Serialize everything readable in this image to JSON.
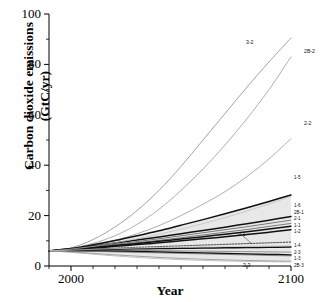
{
  "chart_data": {
    "type": "line",
    "title": "",
    "xlabel": "Year",
    "ylabel": "Carbon dioxide emissions (GtC/yr)",
    "xlim": [
      1990,
      2100
    ],
    "ylim": [
      0,
      100
    ],
    "xticks": [
      2000,
      2100
    ],
    "xtick_labels": [
      "2000",
      "2100"
    ],
    "xminor_ticks": [
      1990,
      2010,
      2020,
      2030,
      2040,
      2050,
      2060,
      2070,
      2080,
      2090
    ],
    "yticks": [
      0,
      20,
      40,
      60,
      80,
      100
    ],
    "ytick_labels": [
      "0",
      "20",
      "40",
      "60",
      "80",
      "100"
    ],
    "yminor_ticks": [
      10,
      30,
      50,
      70,
      90
    ],
    "grid": false,
    "legend": "inline-end-labels",
    "shaded_band": {
      "label": "scenario range envelope",
      "color": "#e8e8e8",
      "upper_2100": 30.5,
      "lower_2100": 4.0
    },
    "x": [
      1990,
      2000,
      2010,
      2020,
      2030,
      2040,
      2050,
      2060,
      2070,
      2080,
      2090,
      2100
    ],
    "series": [
      {
        "name": "3-2",
        "label": "3-2",
        "color": "#8c8c8c",
        "width": 0.8,
        "dash": "none",
        "label_pos": {
          "x": 246,
          "y": 40
        },
        "values": [
          6.0,
          7.2,
          10.5,
          15.5,
          22.0,
          30.0,
          39.5,
          50.0,
          60.5,
          71.0,
          81.0,
          90.5
        ]
      },
      {
        "name": "2B-2",
        "label": "2B-2",
        "color": "#9a9a9a",
        "width": 0.8,
        "dash": "none",
        "label_pos": {
          "x": 304,
          "y": 49
        },
        "values": [
          6.0,
          7.0,
          9.0,
          12.0,
          16.5,
          22.5,
          30.0,
          38.5,
          48.0,
          58.5,
          70.0,
          83.0
        ]
      },
      {
        "name": "2-2",
        "label": "2-2",
        "color": "#9a9a9a",
        "width": 0.8,
        "dash": "none",
        "label_pos": {
          "x": 304,
          "y": 121
        },
        "values": [
          6.0,
          6.8,
          8.2,
          10.2,
          12.8,
          16.0,
          20.0,
          24.5,
          29.5,
          35.5,
          42.5,
          50.5
        ]
      },
      {
        "name": "1-5",
        "label": "1-5",
        "color": "#111111",
        "width": 1.5,
        "dash": "none",
        "values": [
          6.0,
          6.9,
          8.4,
          10.1,
          12.0,
          14.0,
          16.2,
          18.4,
          20.7,
          23.1,
          25.6,
          28.2
        ]
      },
      {
        "name": "1-6",
        "label": "1-6",
        "color": "#111111",
        "width": 1.5,
        "dash": "none",
        "values": [
          6.0,
          6.8,
          7.9,
          9.1,
          10.3,
          11.5,
          12.8,
          14.1,
          15.4,
          16.8,
          18.2,
          19.6
        ]
      },
      {
        "name": "2B-1",
        "label": "2B-1",
        "color": "#5a5a5a",
        "width": 0.8,
        "dash": "none",
        "values": [
          6.0,
          6.7,
          7.6,
          8.6,
          9.7,
          10.8,
          12.0,
          13.2,
          14.4,
          15.6,
          16.9,
          18.2
        ]
      },
      {
        "name": "2-1",
        "label": "2-1",
        "color": "#5a5a5a",
        "width": 0.8,
        "dash": "none",
        "values": [
          6.0,
          6.6,
          7.4,
          8.3,
          9.2,
          10.2,
          11.2,
          12.3,
          13.4,
          14.5,
          15.7,
          16.9
        ]
      },
      {
        "name": "1-1",
        "label": "1-1",
        "color": "#111111",
        "width": 1.5,
        "dash": "none",
        "values": [
          6.0,
          6.6,
          7.3,
          8.1,
          8.9,
          9.8,
          10.7,
          11.6,
          12.6,
          13.6,
          14.7,
          15.8
        ]
      },
      {
        "name": "1-2",
        "label": "1-2",
        "color": "#111111",
        "width": 1.5,
        "dash": "none",
        "values": [
          6.0,
          6.5,
          7.1,
          7.8,
          8.5,
          9.2,
          10.0,
          10.8,
          11.6,
          12.5,
          13.4,
          14.4
        ]
      },
      {
        "name": "3-1",
        "label": "3-1",
        "color": "#222222",
        "width": 0.9,
        "dash": "1.6,1.4",
        "label_pos": {
          "x": 238,
          "y": 232
        },
        "values": [
          6.0,
          6.4,
          6.8,
          7.1,
          7.4,
          7.7,
          8.0,
          8.3,
          8.6,
          8.9,
          9.2,
          9.5
        ]
      },
      {
        "name": "1-4",
        "label": "1-4",
        "color": "#111111",
        "width": 1.5,
        "dash": "none",
        "values": [
          6.0,
          6.2,
          6.4,
          6.6,
          6.8,
          6.9,
          7.0,
          7.1,
          7.2,
          7.3,
          7.4,
          7.5
        ]
      },
      {
        "name": "2-3",
        "label": "2-3",
        "color": "#7a7a7a",
        "width": 0.8,
        "dash": "none",
        "values": [
          6.0,
          6.1,
          6.2,
          6.2,
          6.2,
          6.1,
          6.0,
          5.9,
          5.8,
          5.7,
          5.6,
          5.5
        ]
      },
      {
        "name": "1-3",
        "label": "1-3",
        "color": "#111111",
        "width": 1.5,
        "dash": "none",
        "values": [
          6.0,
          6.0,
          6.0,
          5.9,
          5.8,
          5.6,
          5.4,
          5.2,
          5.0,
          4.8,
          4.6,
          4.4
        ]
      },
      {
        "name": "2B-3",
        "label": "2B-3",
        "color": "#7a7a7a",
        "width": 0.8,
        "dash": "none",
        "values": [
          6.0,
          5.9,
          5.8,
          5.6,
          5.4,
          5.2,
          5.0,
          4.8,
          4.6,
          4.4,
          4.2,
          4.0
        ]
      },
      {
        "name": "3-3",
        "label": "3-3",
        "color": "#8c8c8c",
        "width": 0.8,
        "dash": "none",
        "label_pos": {
          "x": 243,
          "y": 263
        },
        "values": [
          6.0,
          5.6,
          5.0,
          4.4,
          3.9,
          3.4,
          3.0,
          2.7,
          2.4,
          2.2,
          2.0,
          1.9
        ]
      },
      {
        "name": "lower-gray-a",
        "label": "",
        "color": "#a8a8a8",
        "width": 0.7,
        "dash": "none",
        "values": [
          6.0,
          5.4,
          4.7,
          4.0,
          3.4,
          2.9,
          2.5,
          2.2,
          2.0,
          1.8,
          1.7,
          1.6
        ]
      },
      {
        "name": "mid-gray-b",
        "label": "",
        "color": "#bdbdbd",
        "width": 0.7,
        "dash": "none",
        "values": [
          6.0,
          6.7,
          7.8,
          9.2,
          10.8,
          12.6,
          14.6,
          16.8,
          19.2,
          21.8,
          24.6,
          27.6
        ]
      },
      {
        "name": "mid-gray-c",
        "label": "",
        "color": "#c8c8c8",
        "width": 0.7,
        "dash": "none",
        "values": [
          6.0,
          6.3,
          6.6,
          6.9,
          7.1,
          7.3,
          7.5,
          7.6,
          7.7,
          7.8,
          7.9,
          8.0
        ]
      }
    ],
    "end_labels_top": [
      "1-5"
    ],
    "end_labels_mid": [
      "1-6",
      "2B-1",
      "2-1",
      "1-1",
      "1-2"
    ],
    "end_labels_low": [
      "1-4",
      "2-3",
      "1-3",
      "2B-3"
    ]
  }
}
